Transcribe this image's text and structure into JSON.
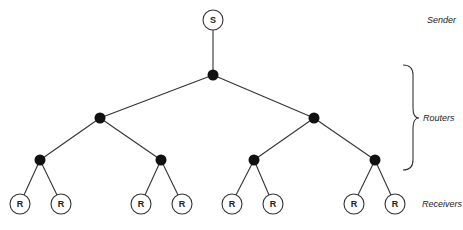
{
  "diagram": {
    "type": "multicast-tree",
    "nodes": {
      "sender": {
        "label": "S",
        "x": 213,
        "y": 20
      },
      "routers": [
        {
          "id": "r0",
          "x": 213,
          "y": 75
        },
        {
          "id": "r1",
          "x": 100,
          "y": 118
        },
        {
          "id": "r2",
          "x": 314,
          "y": 118
        },
        {
          "id": "r3",
          "x": 40,
          "y": 160
        },
        {
          "id": "r4",
          "x": 161,
          "y": 160
        },
        {
          "id": "r5",
          "x": 254,
          "y": 160
        },
        {
          "id": "r6",
          "x": 375,
          "y": 160
        }
      ],
      "receivers": [
        {
          "label": "R",
          "x": 20,
          "y": 204
        },
        {
          "label": "R",
          "x": 61,
          "y": 204
        },
        {
          "label": "R",
          "x": 141,
          "y": 204
        },
        {
          "label": "R",
          "x": 182,
          "y": 204
        },
        {
          "label": "R",
          "x": 232,
          "y": 204
        },
        {
          "label": "R",
          "x": 273,
          "y": 204
        },
        {
          "label": "R",
          "x": 354,
          "y": 204
        },
        {
          "label": "R",
          "x": 395,
          "y": 204
        }
      ]
    },
    "legend": {
      "sender": "Sender",
      "routers": "Routers",
      "receivers": "Receivers"
    }
  }
}
